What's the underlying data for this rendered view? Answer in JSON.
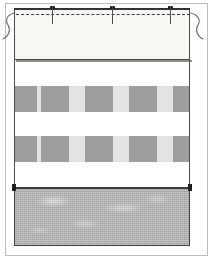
{
  "figure": {
    "width": 214,
    "height": 259,
    "background_color": "#ffffff"
  },
  "frame": {
    "name": "outer-frame",
    "stroke_color": "#bcbcbc"
  },
  "hem_panel": {
    "label": "Top hem panel",
    "fill_color": "#f7f7f4",
    "stroke_color": "#4a4a4a",
    "x": 14,
    "y": 8,
    "width": 176,
    "height": 52
  },
  "stitch_line": {
    "label": "Dashed stitching line",
    "style": "dashed",
    "color": "#3a3a3a",
    "y": 14
  },
  "pins": [
    {
      "label": "pin-1",
      "x": 52
    },
    {
      "label": "pin-2",
      "x": 112
    },
    {
      "label": "pin-3",
      "x": 170
    }
  ],
  "break_marks": [
    {
      "label": "left-break-squiggle",
      "side": "left",
      "x": 2,
      "y": 12
    },
    {
      "label": "right-break-squiggle",
      "side": "right",
      "x": 190,
      "y": 12
    }
  ],
  "fabric_panel": {
    "label": "Gingham check fabric panel",
    "background_color": "#ffffff",
    "band_color": "#e3e3e3",
    "square_color": "#9e9e9e",
    "stroke_color": "#4a4a4a",
    "x": 14,
    "y": 63,
    "width": 176,
    "height": 125,
    "bands": [
      {
        "label": "check-band-upper",
        "top": 23,
        "height": 26
      },
      {
        "label": "check-band-lower",
        "top": 73,
        "height": 26
      }
    ],
    "squares_x": [
      -6,
      26,
      70,
      114,
      158
    ],
    "square_width": 28
  },
  "lower_panel": {
    "label": "Lower solid fabric panel",
    "fill_color": "#b3b3b3",
    "stroke_color": "#3d3d3d",
    "x": 14,
    "y": 188,
    "width": 176,
    "height": 58
  },
  "seam_markers": [
    {
      "label": "seam-marker-left",
      "x": 12,
      "y": 184
    },
    {
      "label": "seam-marker-right",
      "x": 188,
      "y": 184
    }
  ]
}
